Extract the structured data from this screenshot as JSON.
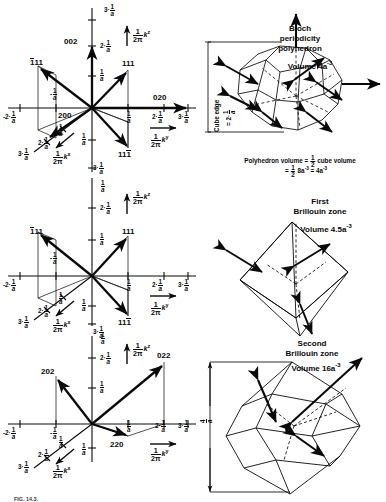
{
  "figure": {
    "caption_fragment": "FIG. 14.3.",
    "axis": {
      "kx": "k",
      "ky": "k",
      "kz": "k",
      "kx_sub": "x",
      "ky_sub": "y",
      "kz_sub": "z",
      "prefix_num": "1",
      "prefix_den": "2π",
      "unit_num": "1",
      "unit_den": "a"
    },
    "ticks": {
      "neg2": "-2·",
      "neg1": "-",
      "one": "",
      "two": "2·",
      "three": "3·"
    },
    "panels": [
      {
        "id": "panel-top-left",
        "kind": "reciprocal-lattice-plot",
        "vector_labels": [
          {
            "name": "1bar11",
            "text": "111",
            "overbar_index": 0
          },
          {
            "name": "111",
            "text": "111",
            "overbar_index": -1
          },
          {
            "name": "11bar1bar",
            "text": "111",
            "overbar_index": 2
          },
          {
            "name": "002",
            "text": "002",
            "overbar_index": -1
          },
          {
            "name": "020",
            "text": "020",
            "overbar_index": -1
          },
          {
            "name": "200",
            "text": "200",
            "overbar_index": -1
          }
        ],
        "tick_labels_y": [
          "3·",
          "2·",
          "",
          "",
          "3·"
        ],
        "tick_labels_x": [
          "-2·",
          "-",
          "",
          "2·",
          "3·"
        ],
        "tick_labels_diag": [
          "2·",
          "3·"
        ]
      },
      {
        "id": "panel-mid-left",
        "kind": "reciprocal-lattice-plot",
        "vector_labels": [
          {
            "name": "1bar11",
            "text": "111",
            "overbar_index": 0
          },
          {
            "name": "111",
            "text": "111",
            "overbar_index": -1
          },
          {
            "name": "11bar1bar",
            "text": "111",
            "overbar_index": 2
          }
        ]
      },
      {
        "id": "panel-bottom-left",
        "kind": "reciprocal-lattice-plot",
        "vector_labels": [
          {
            "name": "202",
            "text": "202"
          },
          {
            "name": "022",
            "text": "022"
          },
          {
            "name": "220",
            "text": "220"
          }
        ]
      },
      {
        "id": "panel-top-right",
        "kind": "polyhedron-truncated-octahedron",
        "title_line1": "Bloch",
        "title_line2": "periodicity",
        "title_line3": "polyhedron",
        "volume_label": "Volume 4a",
        "volume_exp": "-3",
        "dim_label_line1": "Cube edge",
        "dim_label_line2": "= 2·",
        "formula_line1_a": "Polyhedron volume = ",
        "formula_line1_b": " cube volume",
        "formula_line2_a": "= ",
        "formula_line2_b": " 8a",
        "formula_line2_c": "-3",
        "formula_line2_d": " = 4a",
        "formula_line2_e": "-3",
        "half_num": "1",
        "half_den": "2"
      },
      {
        "id": "panel-mid-right",
        "kind": "polyhedron-octahedron",
        "title_line1": "First",
        "title_line2": "Brillouin zone",
        "volume_label": "Volume 4.5a",
        "volume_exp": "-3"
      },
      {
        "id": "panel-bottom-right",
        "kind": "polyhedron-second-zone",
        "title_line1": "Second",
        "title_line2": "Brillouin zone",
        "volume_label": "Volume 16a",
        "volume_exp": "-3",
        "dim_num": "4",
        "dim_den": "a"
      }
    ]
  }
}
